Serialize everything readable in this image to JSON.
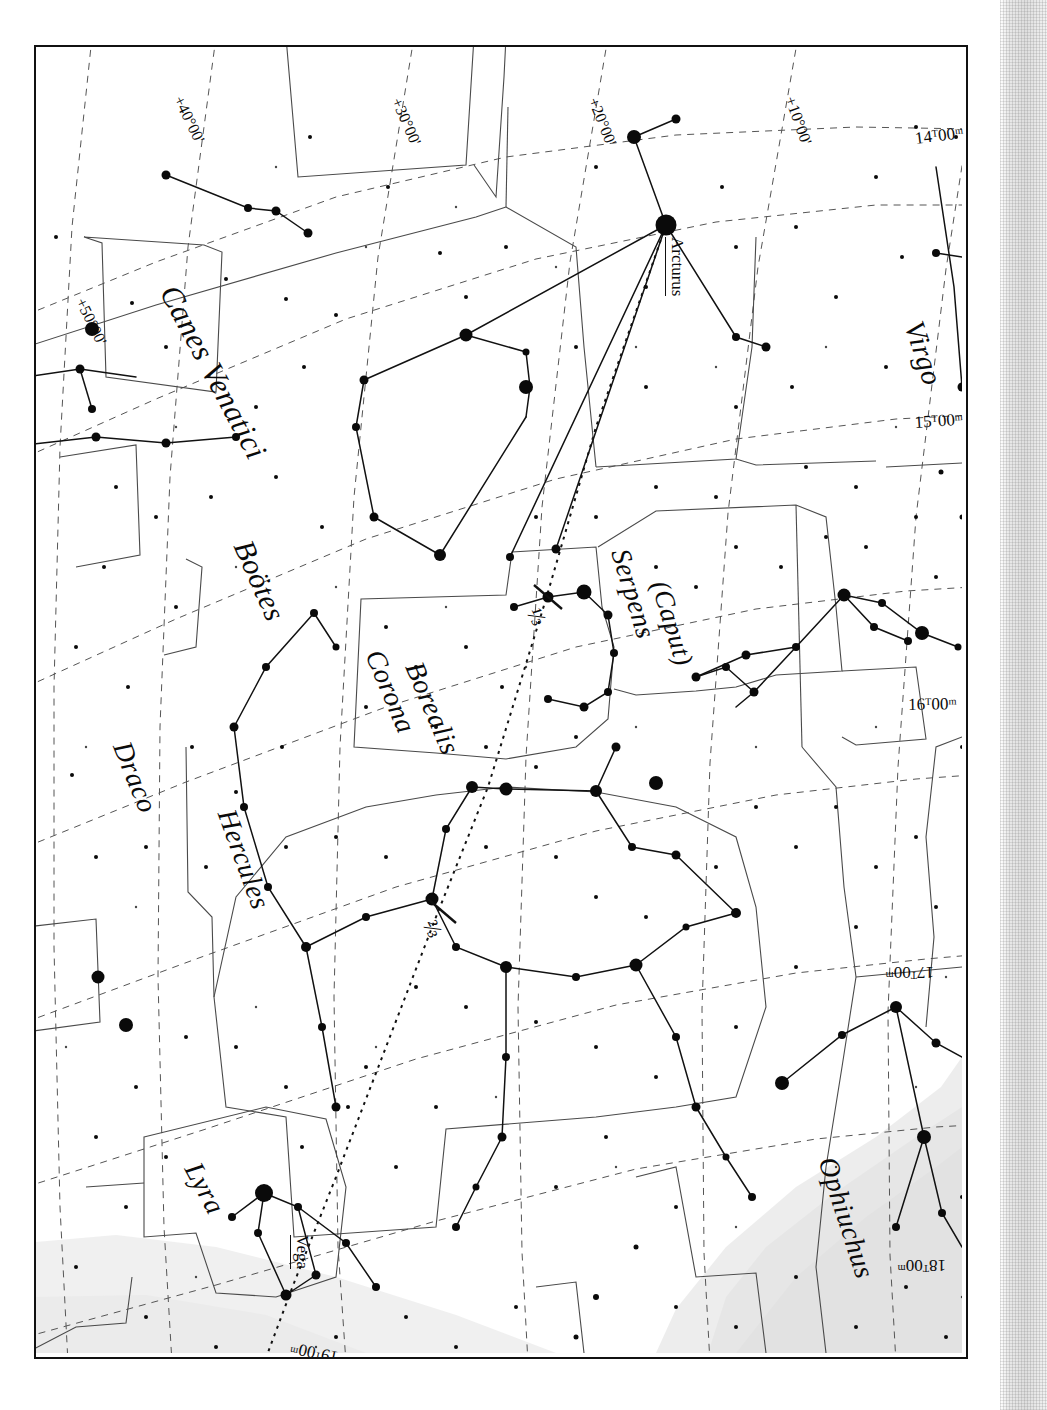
{
  "chart_data": {
    "type": "scatter",
    "xlabel": "Right Ascension",
    "ylabel": "Declination",
    "grid": true,
    "legend": "none",
    "orientation_note": "chart rotated; RA labels read along right edge, Dec labels along top edge",
    "ra_ticks": [
      "14h00m",
      "15h00m",
      "16h00m",
      "17h00m",
      "18h00m",
      "19h00m"
    ],
    "dec_ticks": [
      "+50°00'",
      "+40°00'",
      "+30°00'",
      "+20°00'",
      "+10°00'",
      "+00°00'"
    ],
    "constellations": [
      "Canes Venatici",
      "Virgo",
      "Boötes",
      "Corona Borealis",
      "Serpens (Caput)",
      "Draco",
      "Hercules",
      "Lyra",
      "Ophiuchus"
    ],
    "named_stars": [
      "Arcturus",
      "Vega"
    ],
    "path_fractions": [
      "1/3",
      "2/3"
    ],
    "series": [
      {
        "name": "stars",
        "magnitude_classes": [
          "bright",
          "medium",
          "faint",
          "very faint"
        ]
      }
    ]
  },
  "chart": {
    "constellation_labels": [
      {
        "name": "Canes Venatici",
        "x": 148,
        "y": 232,
        "rot": 62,
        "size": 31
      },
      {
        "name": "Virgo",
        "x": 893,
        "y": 270,
        "rot": 72,
        "size": 29
      },
      {
        "name": "Boötes",
        "x": 222,
        "y": 488,
        "rot": 66,
        "size": 30
      },
      {
        "name": "Corona",
        "x": 352,
        "y": 598,
        "rot": 67,
        "size": 28
      },
      {
        "name": "Borealis",
        "x": 392,
        "y": 610,
        "rot": 67,
        "size": 28
      },
      {
        "name": "Serpens",
        "x": 599,
        "y": 498,
        "rot": 73,
        "size": 28
      },
      {
        "name": "(Caput)",
        "x": 638,
        "y": 530,
        "rot": 73,
        "size": 27
      },
      {
        "name": "Draco",
        "x": 100,
        "y": 690,
        "rot": 68,
        "size": 28
      },
      {
        "name": "Hercules",
        "x": 205,
        "y": 758,
        "rot": 70,
        "size": 28
      },
      {
        "name": "Lyra",
        "x": 170,
        "y": 1110,
        "rot": 62,
        "size": 28
      },
      {
        "name": "Ophiuchus",
        "x": 806,
        "y": 1106,
        "rot": 72,
        "size": 28
      }
    ],
    "coordinate_labels": [
      {
        "text": "+50°00'",
        "x": 52,
        "y": 248,
        "rot": 64
      },
      {
        "text": "+40°00'",
        "x": 150,
        "y": 46,
        "rot": 64
      },
      {
        "text": "+30°00'",
        "x": 368,
        "y": 48,
        "rot": 66
      },
      {
        "text": "+20°00'",
        "x": 565,
        "y": 48,
        "rot": 68
      },
      {
        "text": "+10°00'",
        "x": 762,
        "y": 47,
        "rot": 70
      },
      {
        "text": "+00°00'",
        "x": 962,
        "y": 47,
        "rot": 72
      }
    ],
    "ra_labels": [
      {
        "text": "14ᵀ00ᵐ",
        "x": 878,
        "y": 82,
        "rot": -7,
        "upside": false
      },
      {
        "text": "15ᵀ00ᵐ",
        "x": 878,
        "y": 366,
        "rot": -4,
        "upside": false
      },
      {
        "text": "16ᵀ00ᵐ",
        "x": 872,
        "y": 648,
        "rot": -1,
        "upside": false
      },
      {
        "text": "17ᵀ00ᵐ",
        "x": 898,
        "y": 935,
        "rot": 0,
        "upside": true
      },
      {
        "text": "18ᵀ00ᵐ",
        "x": 910,
        "y": 1228,
        "rot": 0,
        "upside": true
      },
      {
        "text": "19ᵀ00ᵐ",
        "x": 300,
        "y": 1320,
        "rot": 12,
        "upside": true
      }
    ],
    "star_labels": [
      {
        "text": "Arcturus",
        "x": 651,
        "y": 190,
        "rot": 90
      },
      {
        "text": "Vega",
        "x": 276,
        "y": 1188,
        "rot": 90
      }
    ],
    "fraction_labels": [
      {
        "text": "⅓",
        "x": 508,
        "y": 556,
        "rot": 62
      },
      {
        "text": "⅔",
        "x": 404,
        "y": 868,
        "rot": 62
      }
    ]
  }
}
